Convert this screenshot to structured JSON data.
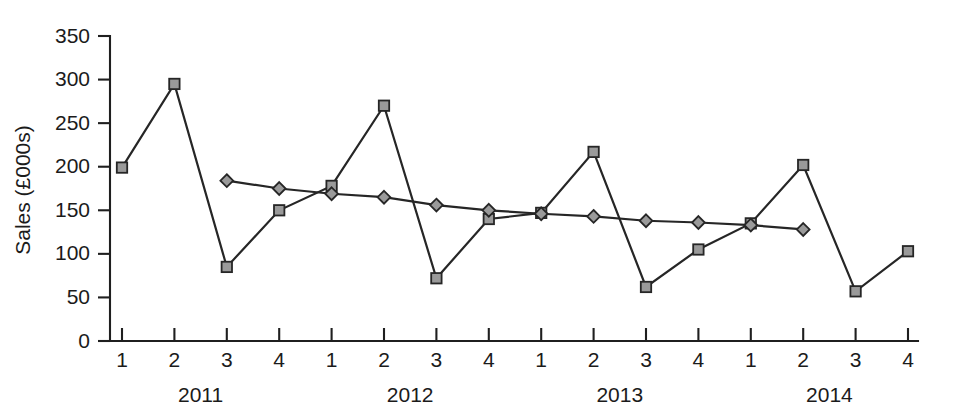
{
  "chart_data": {
    "type": "line",
    "title": "",
    "xlabel": "",
    "ylabel": "Sales (£000s)",
    "ylim": [
      0,
      350
    ],
    "yticks": [
      0,
      50,
      100,
      150,
      200,
      250,
      300,
      350
    ],
    "grid": false,
    "legend_position": "none",
    "categories": [
      "1",
      "2",
      "3",
      "4",
      "1",
      "2",
      "3",
      "4",
      "1",
      "2",
      "3",
      "4",
      "1",
      "2",
      "3",
      "4"
    ],
    "group_labels": [
      "2011",
      "2012",
      "2013",
      "2014"
    ],
    "group_size": 4,
    "x": [
      1,
      2,
      3,
      4,
      5,
      6,
      7,
      8,
      9,
      10,
      11,
      12,
      13,
      14,
      15,
      16
    ],
    "series": [
      {
        "name": "Sales",
        "marker": "square",
        "marker_fill": "#9a9a9a",
        "marker_stroke": "#262626",
        "line_color": "#262626",
        "values": [
          199,
          295,
          85,
          150,
          178,
          270,
          72,
          140,
          147,
          217,
          62,
          105,
          135,
          202,
          57,
          103
        ]
      },
      {
        "name": "Trend (moving average)",
        "marker": "diamond",
        "marker_fill": "#9a9a9a",
        "marker_stroke": "#262626",
        "line_color": "#262626",
        "values": [
          null,
          null,
          184,
          175,
          169,
          165,
          156,
          150,
          146,
          143,
          138,
          136,
          133,
          128,
          null,
          null
        ]
      }
    ]
  },
  "colors": {
    "axis": "#1f1f1f",
    "line": "#262626",
    "marker_fill": "#9a9a9a",
    "background": "#ffffff"
  }
}
